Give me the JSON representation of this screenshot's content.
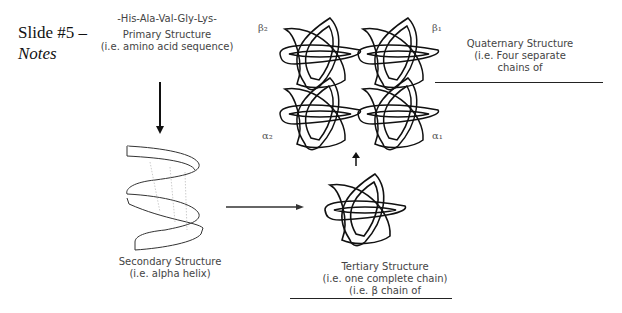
{
  "slide": {
    "title_line1": "Slide #5 –",
    "title_line2": "Notes"
  },
  "primary": {
    "sequence": "-His-Ala-Val-Gly-Lys-",
    "label": "Primary Structure",
    "desc": "(i.e. amino acid sequence)"
  },
  "secondary": {
    "label": "Secondary Structure",
    "desc": "(i.e. alpha helix)"
  },
  "tertiary": {
    "label": "Tertiary Structure",
    "desc1": "(i.e. one complete chain)",
    "desc2": "(i.e. β chain of"
  },
  "quaternary": {
    "label": "Quaternary Structure",
    "desc1": "(i.e. Four separate",
    "desc2": "chains of",
    "subunits": {
      "beta2": "β₂",
      "beta1": "β₁",
      "alpha2": "α₂",
      "alpha1": "α₁"
    }
  }
}
